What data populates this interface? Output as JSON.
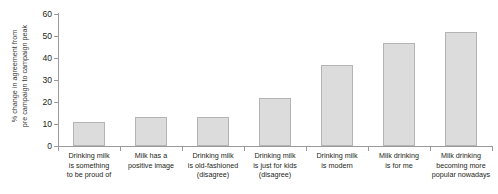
{
  "chart_data": {
    "type": "bar",
    "title": "",
    "subtitle": "",
    "xlabel": "",
    "ylabel": "% change in agreement from pre campaign to campaign peak",
    "ylabel_lines": [
      "% change in agreement from",
      "pre campaign to campaign peak"
    ],
    "ylim": [
      0,
      60
    ],
    "ytick_labels": [
      "0",
      "10",
      "20",
      "30",
      "40",
      "50",
      "60"
    ],
    "ytick_values": [
      0,
      10,
      20,
      30,
      40,
      50,
      60
    ],
    "grid": false,
    "legend": "none",
    "bar_fill_color": "#dcdcdc",
    "bar_border_color": "#b4b4b4",
    "axis_color": "#9a9a9a",
    "categories": [
      "Drinking milk is something to be proud of",
      "Milk has a positive image",
      "Drinking milk is old-fashioned (disagree)",
      "Drinking milk is just for kids (disagree)",
      "Drinking milk is modern",
      "Milk drinking is for me",
      "Milk drinking becoming more popular nowadays"
    ],
    "category_label_lines": [
      [
        "Drinking milk",
        "is something",
        "to be proud of"
      ],
      [
        "Milk has a",
        "positive image"
      ],
      [
        "Drinking milk",
        "is old-fashioned",
        "(disagree)"
      ],
      [
        "Drinking milk",
        "is just for kids",
        "(disagree)"
      ],
      [
        "Drinking milk",
        "is modern"
      ],
      [
        "Milk drinking",
        "is for me"
      ],
      [
        "Milk drinking",
        "becoming more",
        "popular nowadays"
      ]
    ],
    "values": [
      11,
      13,
      13,
      22,
      37,
      47,
      52
    ]
  }
}
